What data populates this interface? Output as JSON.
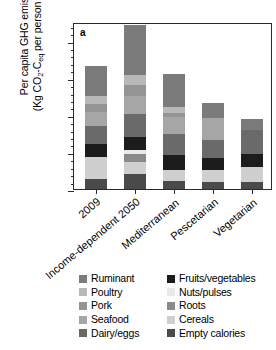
{
  "panel_label": "a",
  "axis": {
    "y_title_line1": "Per capita GHG emissions",
    "y_title_line2_pre": "(Kg CO",
    "y_title_sub1": "2",
    "y_title_mid": "-C",
    "y_title_sub2": "eq",
    "y_title_post": " per person per year)",
    "y_ticks": [
      "0",
      "100",
      "200",
      "300",
      "400"
    ]
  },
  "legend": {
    "items": [
      {
        "label": "Ruminant",
        "color": "#7b7b7b"
      },
      {
        "label": "Fruits/vegetables",
        "color": "#1c1c1c"
      },
      {
        "label": "Poultry",
        "color": "#b8b8b8"
      },
      {
        "label": "Nuts/pulses",
        "color": "#e9e9e9"
      },
      {
        "label": "Pork",
        "color": "#949494"
      },
      {
        "label": "Roots",
        "color": "#8a8a8a"
      },
      {
        "label": "Seafood",
        "color": "#a6a6a6"
      },
      {
        "label": "Cereals",
        "color": "#cfcfcf"
      },
      {
        "label": "Dairy/eggs",
        "color": "#6a6a6a"
      },
      {
        "label": "Empty calories",
        "color": "#4a4a4a"
      }
    ]
  },
  "chart_data": {
    "type": "bar",
    "title": "",
    "xlabel": "",
    "ylabel": "Per capita GHG emissions (Kg CO2-Ceq per person per year)",
    "ylim": [
      0,
      450
    ],
    "yticks": [
      0,
      100,
      200,
      300,
      400
    ],
    "grid": false,
    "stacked": true,
    "legend_position": "below",
    "categories": [
      "2009",
      "Income-dependent 2050",
      "Mediterranean",
      "Pescetarian",
      "Vegetarian"
    ],
    "series": [
      {
        "name": "Empty calories",
        "color": "#4a4a4a",
        "values": [
          28,
          40,
          22,
          18,
          18
        ]
      },
      {
        "name": "Cereals",
        "color": "#cfcfcf",
        "values": [
          58,
          32,
          30,
          32,
          42
        ]
      },
      {
        "name": "Roots",
        "color": "#8a8a8a",
        "values": [
          0,
          22,
          0,
          0,
          0
        ]
      },
      {
        "name": "Nuts/pulses",
        "color": "#e9e9e9",
        "values": [
          0,
          12,
          0,
          0,
          0
        ]
      },
      {
        "name": "Fruits/vegetables",
        "color": "#1c1c1c",
        "values": [
          36,
          34,
          40,
          34,
          34
        ]
      },
      {
        "name": "Dairy/eggs",
        "color": "#6a6a6a",
        "values": [
          48,
          62,
          55,
          48,
          64
        ]
      },
      {
        "name": "Seafood",
        "color": "#a6a6a6",
        "values": [
          38,
          48,
          46,
          60,
          0
        ]
      },
      {
        "name": "Pork",
        "color": "#949494",
        "values": [
          22,
          30,
          12,
          0,
          0
        ]
      },
      {
        "name": "Poultry",
        "color": "#b8b8b8",
        "values": [
          20,
          28,
          16,
          0,
          0
        ]
      },
      {
        "name": "Ruminant",
        "color": "#7b7b7b",
        "values": [
          82,
          135,
          90,
          39,
          30
        ]
      }
    ],
    "totals": [
      332,
      443,
      311,
      231,
      188
    ]
  }
}
